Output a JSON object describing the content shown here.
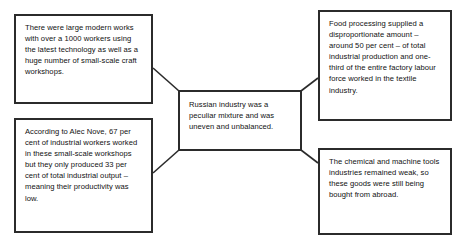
{
  "diagram": {
    "type": "concept-map",
    "title": "Russian industry was a peculiar mixture and was uneven and unbalanced",
    "background_color": "#ffffff",
    "border_color": "#2b2b2b",
    "text_color": "#111111",
    "center": {
      "id": "center",
      "text": "Russian industry was a peculiar mixture and was uneven and unbalanced."
    },
    "nodes": [
      {
        "id": "modern-works",
        "position": "top-left",
        "text": "There were large modern works with over a 1000 workers using the latest technology as well as a huge number of small-scale craft workshops."
      },
      {
        "id": "alec-nove",
        "position": "bottom-left",
        "text": "According to Alec Nove, 67 per cent of industrial workers worked in these small-scale workshops but they only produced 33 per cent of total industrial output – meaning their productivity was low."
      },
      {
        "id": "food-processing",
        "position": "top-right",
        "text": "Food processing supplied a disproportionate amount – around 50 per cent – of total industrial production and one-third of the entire factory labour force worked in the textile industry."
      },
      {
        "id": "chemical",
        "position": "bottom-right",
        "text": "The chemical and machine tools industries remained weak, so these goods were still being bought from abroad."
      }
    ],
    "connectors": [
      {
        "id": "modern-works-to-center",
        "from": "modern-works",
        "to": "center"
      },
      {
        "id": "alec-nove-to-center",
        "from": "alec-nove",
        "to": "center"
      },
      {
        "id": "center-to-food-processing",
        "from": "center",
        "to": "food-processing"
      },
      {
        "id": "center-to-chemical",
        "from": "center",
        "to": "chemical"
      }
    ]
  }
}
